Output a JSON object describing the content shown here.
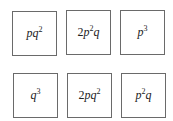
{
  "boxes": [
    {
      "coef": "",
      "base1": "p",
      "exp1": "",
      "base2": "q",
      "exp2": "2",
      "label": "pq^2"
    },
    {
      "coef": "2",
      "base1": "p",
      "exp1": "2",
      "base2": "q",
      "exp2": "",
      "label": "2p^2q"
    },
    {
      "coef": "",
      "base1": "p",
      "exp1": "3",
      "base2": "",
      "exp2": "",
      "label": "p^3"
    },
    {
      "coef": "",
      "base1": "q",
      "exp1": "3",
      "base2": "",
      "exp2": "",
      "label": "q^3"
    },
    {
      "coef": "2",
      "base1": "p",
      "exp1": "",
      "base2": "q",
      "exp2": "2",
      "label": "2pq^2"
    },
    {
      "coef": "",
      "base1": "p",
      "exp1": "2",
      "base2": "q",
      "exp2": "",
      "label": "p^2q"
    }
  ]
}
